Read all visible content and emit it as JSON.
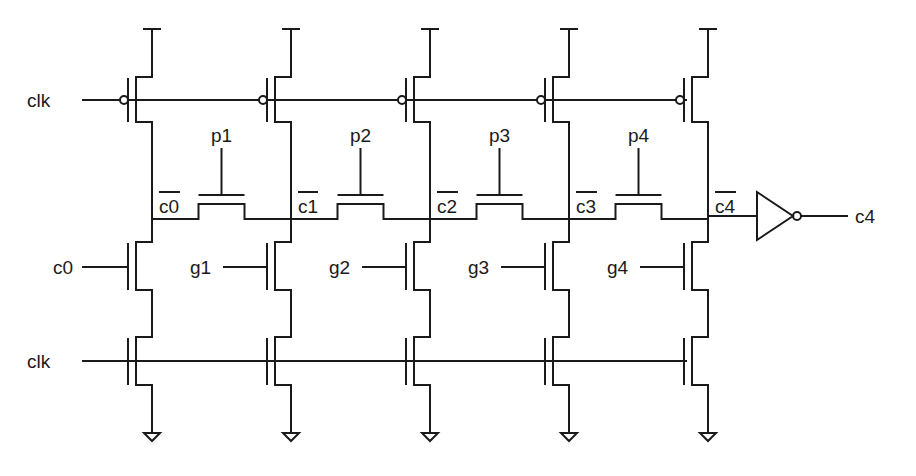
{
  "diagram": {
    "type": "dynamic Manchester carry chain",
    "clock_label": "clk",
    "carry_in_label": "c0",
    "carry_out_label": "c4",
    "stages": [
      {
        "node_label": "c0",
        "node_inverted": true,
        "propagate": "p1",
        "generate": "c0"
      },
      {
        "node_label": "c1",
        "node_inverted": true,
        "propagate": "p2",
        "generate": "g1"
      },
      {
        "node_label": "c2",
        "node_inverted": true,
        "propagate": "p3",
        "generate": "g2"
      },
      {
        "node_label": "c3",
        "node_inverted": true,
        "propagate": "p4",
        "generate": "g3"
      },
      {
        "node_label": "c4",
        "node_inverted": true,
        "propagate": null,
        "generate": "g4"
      }
    ],
    "labels": {
      "clk_top": "clk",
      "clk_bottom": "clk",
      "c0_in": "c0",
      "p1": "p1",
      "p2": "p2",
      "p3": "p3",
      "p4": "p4",
      "g1": "g1",
      "g2": "g2",
      "g3": "g3",
      "g4": "g4",
      "n0": "c0",
      "n1": "c1",
      "n2": "c2",
      "n3": "c3",
      "n4": "c4",
      "out": "c4"
    },
    "colors": {
      "ink": "#1a1a1a",
      "background": "#ffffff"
    }
  }
}
